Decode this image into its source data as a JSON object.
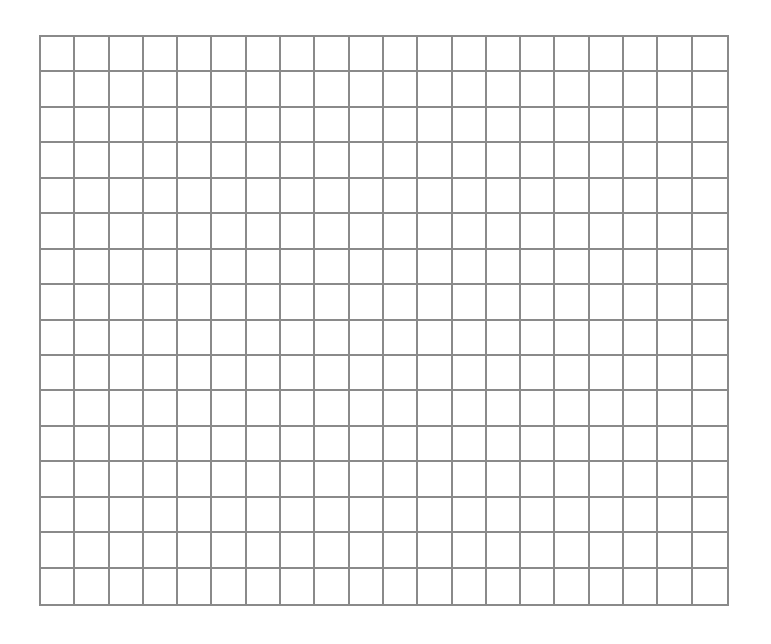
{
  "grid": {
    "columns": 20,
    "rows": 16,
    "line_color": "#8a8a8a",
    "background": "#ffffff",
    "cells_filled": []
  }
}
